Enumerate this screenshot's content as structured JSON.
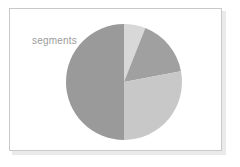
{
  "figure": {
    "background_color": "#ffffff",
    "frame": {
      "border_color": "#c9c9c9",
      "fill_color": "#ffffff",
      "shadow_color": "#d9d9d9"
    }
  },
  "title": {
    "text": "segments",
    "color": "#9b9b9b"
  },
  "chart_data": {
    "type": "pie",
    "title": "segments",
    "xlabel": "",
    "ylabel": "",
    "grid": false,
    "legend": "none",
    "start_angle_deg": 0,
    "direction": "clockwise",
    "center_px": {
      "x": 124,
      "y": 82
    },
    "radius_px": 58,
    "labels": [
      "segment 1",
      "segment 2",
      "segment 3",
      "segment 4"
    ],
    "values": [
      6,
      16,
      28,
      50
    ],
    "percentages": [
      6,
      16,
      28,
      50
    ],
    "angles_deg": [
      21.6,
      57.6,
      100.8,
      180.0
    ],
    "colors": [
      "#d8d8d8",
      "#a0a0a0",
      "#c8c8c8",
      "#9a9a9a"
    ],
    "slices": [
      {
        "label": "segment 1",
        "value": 6,
        "percent": 6,
        "color": "#d8d8d8",
        "start_angle_deg": 0,
        "end_angle_deg": 21.6
      },
      {
        "label": "segment 2",
        "value": 16,
        "percent": 16,
        "color": "#a0a0a0",
        "start_angle_deg": 21.6,
        "end_angle_deg": 79.2
      },
      {
        "label": "segment 3",
        "value": 28,
        "percent": 28,
        "color": "#c8c8c8",
        "start_angle_deg": 79.2,
        "end_angle_deg": 180.0
      },
      {
        "label": "segment 4",
        "value": 50,
        "percent": 50,
        "color": "#9a9a9a",
        "start_angle_deg": 180.0,
        "end_angle_deg": 360.0
      }
    ]
  }
}
